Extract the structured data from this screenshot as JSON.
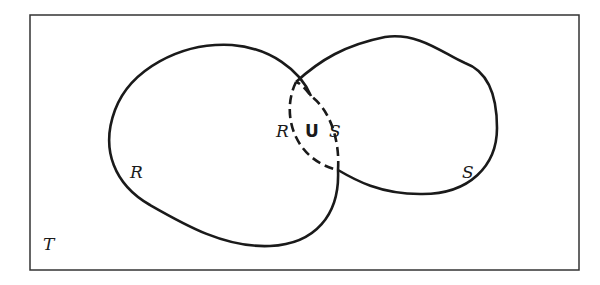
{
  "diagram": {
    "type": "venn",
    "universe_label": "T",
    "sets": [
      {
        "name": "R",
        "label": "R"
      },
      {
        "name": "S",
        "label": "S"
      }
    ],
    "union_label": {
      "left": "R",
      "op": "U",
      "right": "S"
    },
    "colors": {
      "stroke": "#1a1a1a",
      "background": "#ffffff"
    }
  }
}
